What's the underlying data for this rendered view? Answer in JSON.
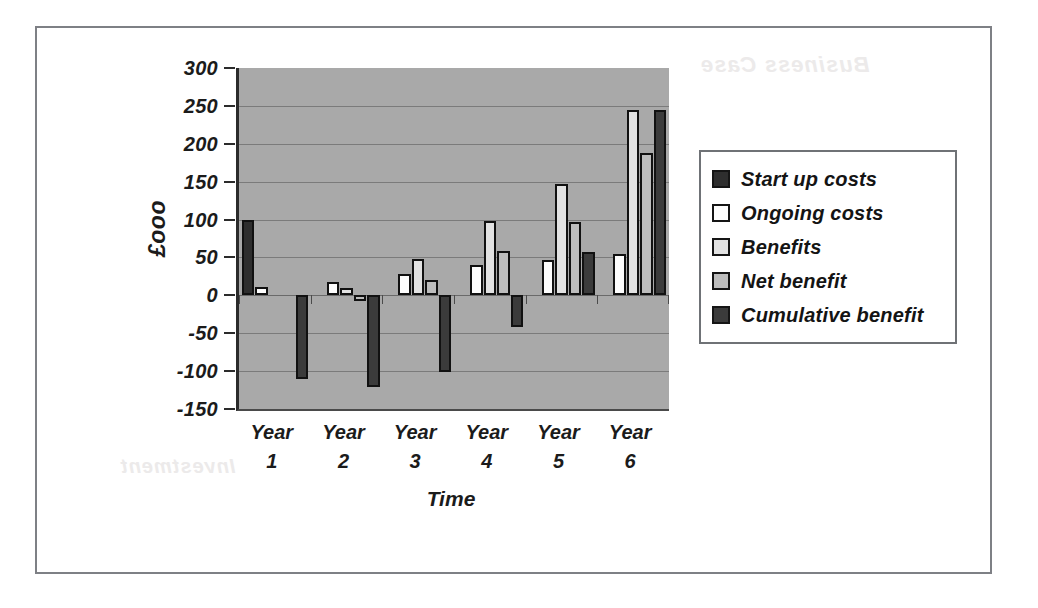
{
  "chart_data": {
    "type": "bar",
    "title": "",
    "xlabel": "Time",
    "ylabel": "£ooo",
    "categories": [
      "Year 1",
      "Year 2",
      "Year 3",
      "Year 4",
      "Year 5",
      "Year 6"
    ],
    "category_lines": [
      [
        "Year",
        "1"
      ],
      [
        "Year",
        "2"
      ],
      [
        "Year",
        "3"
      ],
      [
        "Year",
        "4"
      ],
      [
        "Year",
        "5"
      ],
      [
        "Year",
        "6"
      ]
    ],
    "ylim": [
      -150,
      300
    ],
    "y_ticks": [
      300,
      250,
      200,
      150,
      100,
      50,
      0,
      -50,
      -100,
      -150
    ],
    "y_tick_labels": [
      "300",
      "250",
      "200",
      "150",
      "100",
      "50",
      "0",
      "-50",
      "-100",
      "-150"
    ],
    "grid": true,
    "legend_position": "right",
    "series": [
      {
        "name": "Start up costs",
        "color": "#2e2e2e",
        "swatch_class": "sw-startup",
        "values": [
          100,
          0,
          0,
          0,
          0,
          0
        ]
      },
      {
        "name": "Ongoing costs",
        "color": "#fdfdfd",
        "swatch_class": "sw-ongoing",
        "values": [
          11,
          18,
          28,
          40,
          47,
          55
        ]
      },
      {
        "name": "Benefits",
        "color": "#e2e2e2",
        "swatch_class": "sw-benefits",
        "values": [
          0,
          10,
          48,
          98,
          147,
          245
        ]
      },
      {
        "name": "Net benefit",
        "color": "#bdbdbd",
        "swatch_class": "sw-netbenefit",
        "values": [
          0,
          -8,
          20,
          58,
          97,
          188
        ]
      },
      {
        "name": "Cumulative benefit",
        "color": "#3b3b3b",
        "swatch_class": "sw-cumulative",
        "values": [
          -111,
          -121,
          -101,
          -42,
          57,
          245
        ]
      }
    ]
  },
  "legend": {
    "items": [
      {
        "label": "Start up costs",
        "swatch_class": "sw-startup"
      },
      {
        "label": "Ongoing costs",
        "swatch_class": "sw-ongoing"
      },
      {
        "label": "Benefits",
        "swatch_class": "sw-benefits"
      },
      {
        "label": "Net benefit",
        "swatch_class": "sw-netbenefit"
      },
      {
        "label": "Cumulative benefit",
        "swatch_class": "sw-cumulative"
      }
    ]
  },
  "page": {
    "background_bleed": [
      {
        "text": "Business Case",
        "x": 700,
        "y": 52,
        "size": 22
      },
      {
        "text": "Investment",
        "x": 120,
        "y": 455,
        "size": 20
      }
    ]
  },
  "colors": {
    "plot_background": "#a9a9a9",
    "gridline": "#7b7b7b",
    "axis": "#2b2b2b",
    "frame": "#7e8085",
    "text": "#1b1b1b"
  }
}
